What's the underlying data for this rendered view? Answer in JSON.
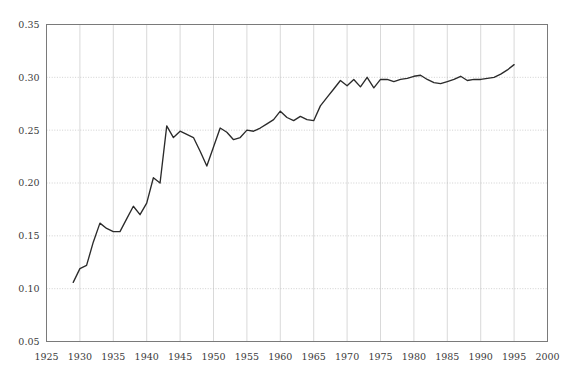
{
  "chart_data": {
    "type": "line",
    "title": "",
    "subtitle": "",
    "xlabel": "",
    "ylabel": "",
    "xlim": [
      1925,
      2000
    ],
    "ylim": [
      0.05,
      0.35
    ],
    "grid": true,
    "legend": null,
    "x_ticks": [
      1925,
      1930,
      1935,
      1940,
      1945,
      1950,
      1955,
      1960,
      1965,
      1970,
      1975,
      1980,
      1985,
      1990,
      1995,
      2000
    ],
    "x_tick_labels": [
      "1925",
      "1930",
      "1935",
      "1940",
      "1945",
      "1950",
      "1955",
      "1960",
      "1965",
      "1970",
      "1975",
      "1980",
      "1985",
      "1990",
      "1995",
      "2000"
    ],
    "y_ticks": [
      0.05,
      0.1,
      0.15,
      0.2,
      0.25,
      0.3,
      0.35
    ],
    "y_tick_labels": [
      "0.05",
      "0.10",
      "0.15",
      "0.20",
      "0.25",
      "0.30",
      "0.35"
    ],
    "line_color": "#2b2b2b",
    "series": [
      {
        "name": "series-1",
        "x": [
          1929,
          1930,
          1931,
          1932,
          1933,
          1934,
          1935,
          1936,
          1937,
          1938,
          1939,
          1940,
          1941,
          1942,
          1943,
          1944,
          1945,
          1946,
          1947,
          1948,
          1949,
          1950,
          1951,
          1952,
          1953,
          1954,
          1955,
          1956,
          1957,
          1958,
          1959,
          1960,
          1961,
          1962,
          1963,
          1964,
          1965,
          1966,
          1967,
          1968,
          1969,
          1970,
          1971,
          1972,
          1973,
          1974,
          1975,
          1976,
          1977,
          1978,
          1979,
          1980,
          1981,
          1982,
          1983,
          1984,
          1985,
          1986,
          1987,
          1988,
          1989,
          1990,
          1991,
          1992,
          1993,
          1994,
          1995
        ],
        "y": [
          0.106,
          0.119,
          0.122,
          0.144,
          0.162,
          0.157,
          0.154,
          0.154,
          0.166,
          0.178,
          0.17,
          0.181,
          0.205,
          0.2,
          0.254,
          0.243,
          0.249,
          0.246,
          0.243,
          0.23,
          0.216,
          0.234,
          0.252,
          0.248,
          0.241,
          0.243,
          0.25,
          0.249,
          0.252,
          0.256,
          0.26,
          0.268,
          0.262,
          0.259,
          0.263,
          0.26,
          0.259,
          0.273,
          0.281,
          0.289,
          0.297,
          0.292,
          0.298,
          0.291,
          0.3,
          0.29,
          0.298,
          0.298,
          0.296,
          0.298,
          0.299,
          0.301,
          0.302,
          0.298,
          0.295,
          0.294,
          0.296,
          0.298,
          0.301,
          0.297,
          0.298,
          0.298,
          0.299,
          0.3,
          0.303,
          0.307,
          0.312
        ]
      }
    ]
  }
}
